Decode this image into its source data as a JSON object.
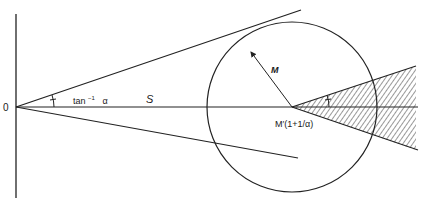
{
  "diagram": {
    "labels": {
      "origin": "0",
      "angle": "tan",
      "angle_sup": "−1",
      "angle_var": "α",
      "distance": "S",
      "radius": "M",
      "center": "M′(1+1/α)"
    },
    "colors": {
      "stroke": "#222222",
      "hatch": "#333333",
      "background": "#ffffff"
    }
  }
}
